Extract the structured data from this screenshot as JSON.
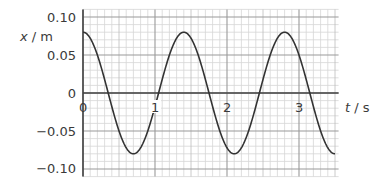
{
  "chart_data": {
    "type": "line",
    "title": "",
    "xlabel": "t / s",
    "xlabel_var": "t",
    "xlabel_unit": "s",
    "ylabel": "x / m",
    "ylabel_var": "x",
    "ylabel_unit": "m",
    "xlim": [
      0,
      3.55
    ],
    "ylim": [
      -0.11,
      0.11
    ],
    "x_ticks": [
      0,
      1,
      2,
      3
    ],
    "x_tick_labels": [
      "0",
      "1",
      "2",
      "3"
    ],
    "y_ticks": [
      0.1,
      0.05,
      0,
      -0.05,
      -0.1
    ],
    "y_tick_labels": [
      "0.10",
      "0.05",
      "0",
      "−0.05",
      "−0.10"
    ],
    "grid": true,
    "grid_minor_x": 0.1,
    "grid_minor_y": 0.01,
    "legend": null,
    "series": [
      {
        "name": "displacement",
        "function": "x = 0.08 cos(2πt / 1.4)",
        "amplitude": 0.08,
        "period": 1.4,
        "x": [
          0,
          0.35,
          0.7,
          1.05,
          1.4,
          1.75,
          2.1,
          2.45,
          2.8,
          3.15,
          3.5
        ],
        "values": [
          0.08,
          0,
          -0.08,
          0,
          0.08,
          0,
          -0.08,
          0,
          0.08,
          0,
          -0.08
        ]
      }
    ]
  },
  "labels": {
    "y_axis_var": "x",
    "y_axis_unit": " / m",
    "x_axis_var": "t",
    "x_axis_unit": " / s",
    "y_ticks": [
      "0.10",
      "0.05",
      "0",
      "−0.05",
      "−0.10"
    ],
    "x_ticks": [
      "0",
      "1",
      "2",
      "3"
    ]
  },
  "colors": {
    "curve": "#333333",
    "axis": "#444444",
    "grid_major": "#9a9a9a",
    "grid_minor": "#d6d6d6"
  }
}
